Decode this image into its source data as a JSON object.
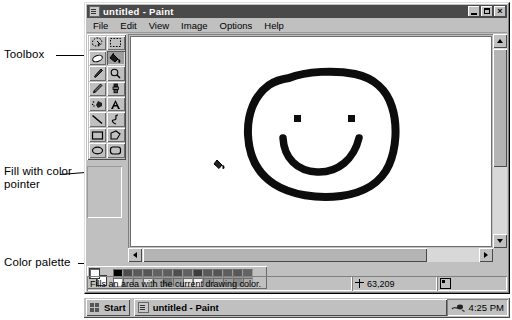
{
  "annotations": [
    {
      "id": "toolbox",
      "label": "Toolbox"
    },
    {
      "id": "fill-pointer",
      "label": "Fill with color\npointer"
    },
    {
      "id": "color-palette",
      "label": "Color palette"
    }
  ],
  "window": {
    "title": "untitled - Paint",
    "icon": "paint-app-icon",
    "controls": [
      {
        "name": "minimize-button",
        "label": "_"
      },
      {
        "name": "maximize-button",
        "label": "□"
      },
      {
        "name": "close-button",
        "label": "×"
      }
    ],
    "menu": [
      "File",
      "Edit",
      "View",
      "Image",
      "Options",
      "Help"
    ]
  },
  "toolbox": {
    "tools": [
      {
        "name": "free-form-select-tool",
        "icon": "free-form-select-icon",
        "selected": false
      },
      {
        "name": "rectangle-select-tool",
        "icon": "rectangle-select-icon",
        "selected": false
      },
      {
        "name": "eraser-tool",
        "icon": "eraser-icon",
        "selected": false
      },
      {
        "name": "fill-with-color-tool",
        "icon": "paint-bucket-icon",
        "selected": true
      },
      {
        "name": "pick-color-tool",
        "icon": "eyedropper-icon",
        "selected": false
      },
      {
        "name": "magnifier-tool",
        "icon": "magnifier-icon",
        "selected": false
      },
      {
        "name": "pencil-tool",
        "icon": "pencil-icon",
        "selected": false
      },
      {
        "name": "brush-tool",
        "icon": "brush-icon",
        "selected": false
      },
      {
        "name": "airbrush-tool",
        "icon": "airbrush-icon",
        "selected": false
      },
      {
        "name": "text-tool",
        "icon": "text-a-icon",
        "selected": false
      },
      {
        "name": "line-tool",
        "icon": "line-icon",
        "selected": false
      },
      {
        "name": "curve-tool",
        "icon": "curve-icon",
        "selected": false
      },
      {
        "name": "rectangle-tool",
        "icon": "rectangle-icon",
        "selected": false
      },
      {
        "name": "polygon-tool",
        "icon": "polygon-icon",
        "selected": false
      },
      {
        "name": "ellipse-tool",
        "icon": "ellipse-icon",
        "selected": false
      },
      {
        "name": "rounded-rectangle-tool",
        "icon": "rounded-rectangle-icon",
        "selected": false
      }
    ]
  },
  "palette": {
    "foreground_color": "#000000",
    "background_color": "#ffffff",
    "row_top": [
      "#000000",
      "#4d4d4d",
      "#5a5a5a",
      "#565656",
      "#626262",
      "#5e5e5e",
      "#4f4f4f",
      "#606060",
      "#3d3d3d",
      "#595959",
      "#555555",
      "#5d5d5d",
      "#585858",
      "#636363"
    ],
    "row_bottom": [
      "#ffffff",
      "#b8b8b8",
      "#b0b0b0",
      "#e0e0e0",
      "#a8a8a8",
      "#7a7a7a",
      "#9c9c9c",
      "#e8e8e8",
      "#f0f0f0",
      "#8f8f8f",
      "#a4a4a4",
      "#9a9a9a",
      "#8a8a8a",
      "#acacac"
    ]
  },
  "canvas": {
    "drawing": "hand-drawn-smiley-face",
    "cursor": "paint-bucket-cursor",
    "cursor_x": 84,
    "cursor_y": 126
  },
  "statusbar": {
    "hint": "Fills an area with the current drawing color.",
    "coordinates": "63,209",
    "size": ""
  },
  "taskbar": {
    "start_label": "Start",
    "task_label": "untitled - Paint",
    "clock": "4:25 PM"
  }
}
